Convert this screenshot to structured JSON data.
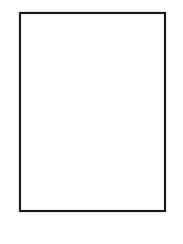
{
  "figure": {
    "kind": "contour-line-map",
    "title": "",
    "caption": "",
    "width": 183,
    "height": 244,
    "background_color": "#ffffff",
    "line_color": "#1c1c1c",
    "frame": {
      "label": "map-frame",
      "x": 20,
      "y": 13,
      "width": 145,
      "height": 198,
      "stroke_color": "#1a1a1a",
      "stroke_width": 2.1
    }
  },
  "chart_data": {
    "type": "line",
    "title": "",
    "subtitle": "",
    "xlabel": "",
    "ylabel": "",
    "grid": false,
    "legend": "none",
    "xlim": [
      20,
      165
    ],
    "ylim": [
      13,
      211
    ],
    "series": [
      {
        "name": "contour-1-top-left",
        "label": "upper left ridge line",
        "stroke": "#1c1c1c",
        "width": 0.95,
        "points": "20,45 24,44 28,41 32,38 36,35 39,33 41,31 42,27 47,26 53,25 58,24 63,23 66,22 70,20 75,18 80,17 85,16 90,15 95,14 100,13"
      },
      {
        "name": "contour-2-upper-band",
        "label": "second ridge line crossing upper third",
        "stroke": "#1c1c1c",
        "width": 0.95,
        "points": "20,90 24,89 28,88 32,87 35,85 38,82 40,79 42,77 44,75 46,74 48,73 49,68 54,67 58,65 60,63 62,60 64,58 66,56 68,54 70,52 73,50 77,48 81,46 85,44 89,42 92,40 96,38 100,36 104,34 107,33 110,31 113,30 116,29 120,28 124,26 128,25 132,24 136,23 140,22 145,21 150,20 155,19 160,18 165,17"
      },
      {
        "name": "contour-3-valley-u",
        "label": "central U-shaped valley contour",
        "stroke": "#1c1c1c",
        "width": 0.95,
        "points": "165,46 160,47 155,48 150,49 145,50 140,51 136,52 132,53 129,55 126,57 124,58 122,56 119,55 116,55 113,56 110,58 107,60 104,62 101,64 98,66 95,68 92,70 89,72 86,74 83,76 80,78 77,80 74,82 71,84 68,86 65,88 63,90 61,92 59,90 56,89 53,89 51,91 50,94 48,97 45,100 42,103 40,106 38,109 37,112 36,115 35,118 35,121 36,124 38,126 39,128 37,130 36,133 37,135 40,136 44,137 47,138 50,139 54,141 58,143 62,145 66,147 70,149 74,151 78,152 82,153 86,154 90,155 94,156 98,156 102,155 105,153 108,152 112,152 116,152 120,152 124,153 128,154 132,155 136,156 139,158 142,160 145,161 148,161 151,160 154,159 157,158 160,157 165,156"
      },
      {
        "name": "contour-4-right-upper",
        "label": "right side contour above the spike",
        "stroke": "#1c1c1c",
        "width": 0.95,
        "points": "165,74 161,75 157,76 153,77 150,78 147,79 144,79 141,78 139,77 137,76 135,76 133,77 131,78 129,79 127,80 125,81 124,82 123,84 122,86 121,88 120,90 119,92 118,94"
      },
      {
        "name": "contour-5-spike-prong",
        "label": "sharp zigzag prong feature on right-center",
        "stroke": "#1c1c1c",
        "width": 1.35,
        "points": "118,94 117,96 116,98 115,100 113,101 111,102 109,103 107,104 109,105 111,106 113,107 115,108 117,108 119,108 121,107 123,107 125,108 127,109 129,110 131,111 133,112 136,112 139,112 142,112 145,112 148,113 151,114 154,115 157,116 160,117 165,118"
      },
      {
        "name": "contour-6-bottom-left-upper",
        "label": "lower band contour entering left edge",
        "stroke": "#1c1c1c",
        "width": 0.95,
        "points": "20,167 24,167 28,167 32,168 35,169 38,171 40,173 42,175 45,177 48,178 51,179 54,180 57,181 60,182 63,183 66,184 69,184 72,184 75,185 78,186 81,188 84,190 87,192 90,193 93,194 96,195 99,196 102,197 105,198 108,199 111,200 114,201 117,202 120,203 123,204 126,205 129,206 132,207 135,208 138,209 141,210 144,210 148,210 152,209 156,208 160,207 165,206"
      },
      {
        "name": "contour-7-bottom-left-lower",
        "label": "lowest contour near bottom left corner",
        "stroke": "#1c1c1c",
        "width": 0.95,
        "points": "20,190 23,190 26,191 29,192 32,194 35,196 38,198 41,200 44,202 47,204 50,206 53,208 56,210 59,211"
      },
      {
        "name": "contour-8-right-lower-tail",
        "label": "short contour exiting lower right edge",
        "stroke": "#1c1c1c",
        "width": 0.95,
        "points": "132,155 135,157 139,159 143,161 147,162 151,162 155,161 159,160 165,159"
      }
    ],
    "annotations": [],
    "tick_labels": {
      "x": [],
      "y": []
    }
  }
}
